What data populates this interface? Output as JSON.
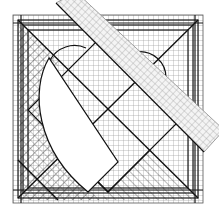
{
  "diagram": {
    "title": "Heart quilt block with grid and diagonal ruler",
    "colors": {
      "background": "#ffffff",
      "grid_line": "#9a9a9a",
      "bold_line": "#1a1a1a",
      "ruler_fill": "#f2f2f2",
      "ruler_grid": "#a8a8a8",
      "heart_fill": "#ffffff"
    },
    "block": {
      "x": 13,
      "y": 15,
      "size": 190,
      "grid_step": 5
    },
    "ruler": {
      "points": "56,3 76,-8 224,130 204,152",
      "grid_step": 5
    },
    "heart": {
      "path": "M 49,58 C 30,90 36,150 88,192 L 118,162 L 49,58 Z"
    }
  }
}
